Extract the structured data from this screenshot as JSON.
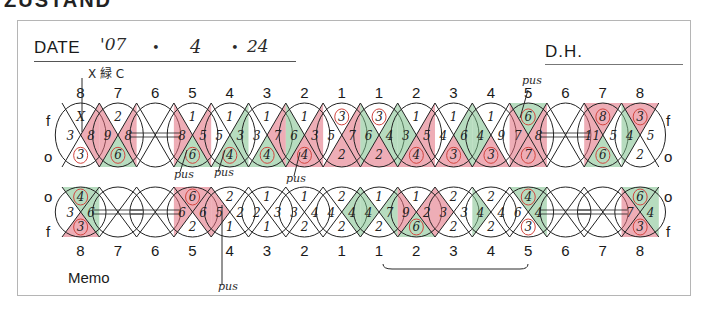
{
  "page_heading_cut": "ZUSTAND",
  "header": {
    "date_label": "DATE",
    "date_year": "'07",
    "date_sep1": "•",
    "date_month": "4",
    "date_sep2": "•",
    "date_day": "24",
    "dh_label": "D.H."
  },
  "annotations": {
    "top_left_note": "X 緑 C",
    "pus_labels": [
      "pus",
      "pus",
      "pus",
      "pus",
      "pus"
    ]
  },
  "upper_chart": {
    "side_top": "f",
    "side_bottom": "o",
    "tooth_numbers": [
      "8",
      "7",
      "6",
      "5",
      "4",
      "3",
      "2",
      "1",
      "1",
      "2",
      "3",
      "4",
      "5",
      "6",
      "7",
      "8"
    ],
    "tooth_values": [
      {
        "f": "X",
        "m": "3",
        "c": "8",
        "o": "3"
      },
      {
        "f": "2",
        "m": "9",
        "c": "8",
        "o": "6"
      },
      {
        "f": "",
        "m": "",
        "c": "",
        "o": ""
      },
      {
        "f": "1",
        "m": "8",
        "c": "5",
        "o": "6"
      },
      {
        "f": "1",
        "m": "5",
        "c": "3",
        "o": "4"
      },
      {
        "f": "1",
        "m": "3",
        "c": "7",
        "o": "4"
      },
      {
        "f": "1",
        "m": "6",
        "c": "3",
        "o": "4"
      },
      {
        "f": "3",
        "m": "5",
        "c": "7",
        "o": "2"
      },
      {
        "f": "3",
        "m": "6",
        "c": "4",
        "o": "2"
      },
      {
        "f": "1",
        "m": "3",
        "c": "5",
        "o": "4"
      },
      {
        "f": "1",
        "m": "4",
        "c": "6",
        "o": "3"
      },
      {
        "f": "1",
        "m": "4",
        "c": "9",
        "o": "3"
      },
      {
        "f": "6",
        "m": "7",
        "c": "8",
        "o": "7"
      },
      {
        "f": "",
        "m": "",
        "c": "",
        "o": ""
      },
      {
        "f": "8",
        "m": "11",
        "c": "5",
        "o": "6"
      },
      {
        "f": "3",
        "m": "4",
        "c": "5",
        "o": "2"
      }
    ]
  },
  "lower_chart": {
    "side_top": "o",
    "side_bottom": "f",
    "tooth_numbers": [
      "8",
      "7",
      "6",
      "5",
      "4",
      "3",
      "2",
      "1",
      "1",
      "2",
      "3",
      "4",
      "5",
      "6",
      "7",
      "8"
    ],
    "tooth_values": [
      {
        "o": "4",
        "m": "3",
        "c": "6",
        "f": "3"
      },
      {
        "o": "",
        "m": "",
        "c": "",
        "f": ""
      },
      {
        "o": "",
        "m": "",
        "c": "",
        "f": ""
      },
      {
        "o": "6",
        "m": "6",
        "c": "6",
        "f": "2"
      },
      {
        "o": "2",
        "m": "5",
        "c": "2",
        "f": "1"
      },
      {
        "o": "1",
        "m": "2",
        "c": "3",
        "f": "1"
      },
      {
        "o": "1",
        "m": "3",
        "c": "4",
        "f": "2"
      },
      {
        "o": "2",
        "m": "4",
        "c": "4",
        "f": "2"
      },
      {
        "o": "1",
        "m": "4",
        "c": "7",
        "f": "2"
      },
      {
        "o": "1",
        "m": "9",
        "c": "2",
        "f": "6"
      },
      {
        "o": "2",
        "m": "3",
        "c": "3",
        "f": "2"
      },
      {
        "o": "2",
        "m": "4",
        "c": "4",
        "f": "2"
      },
      {
        "o": "4",
        "m": "6",
        "c": "4",
        "f": "3"
      },
      {
        "o": "",
        "m": "",
        "c": "",
        "f": ""
      },
      {
        "o": "",
        "m": "",
        "c": "",
        "f": ""
      },
      {
        "o": "6",
        "m": "7",
        "c": "4",
        "f": "3"
      }
    ],
    "memo_label": "Memo"
  },
  "colors": {
    "red_highlight": "#e06a7a",
    "green_highlight": "#7bbf8a",
    "red_circle": "#d2453f",
    "ink": "#222222",
    "frame_border": "#b5b5b5"
  }
}
